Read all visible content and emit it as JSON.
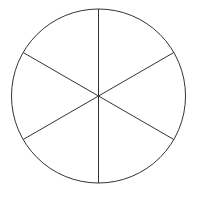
{
  "diagram": {
    "type": "divided-circle",
    "sectors": 6,
    "center": [
      98.5,
      96
    ],
    "radius": 87,
    "spoke_angles_deg": [
      90,
      30,
      -30,
      -90,
      -150,
      150
    ],
    "colors": {
      "stroke": "#333333",
      "fill": "#ffffff"
    }
  }
}
